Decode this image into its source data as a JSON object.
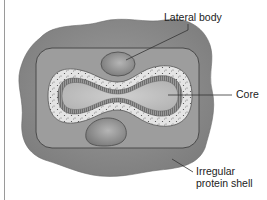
{
  "diagram": {
    "type": "poxvirus-structure",
    "labels": {
      "lateral_body": "Lateral body",
      "core": "Core",
      "shell_line1": "Irregular",
      "shell_line2": "protein shell"
    },
    "colors": {
      "outer_shell": "#8c8c8c",
      "inner_envelope": "#9a9a9a",
      "envelope_border": "#4a4a4a",
      "lateral_body": "#8a8a8a",
      "core_speckled_layer": "#e2e2e2",
      "core_striated_wall": "#8e8e8e",
      "core_interior": "#c4c4c4",
      "leader_line": "#333333"
    }
  }
}
